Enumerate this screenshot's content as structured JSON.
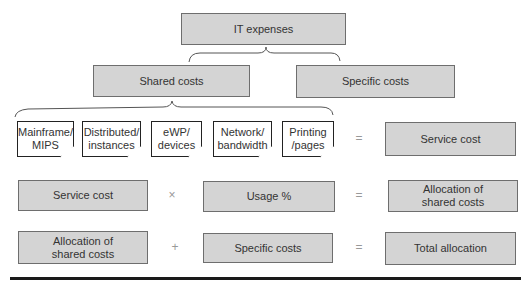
{
  "diagram": {
    "top": {
      "label": "IT expenses"
    },
    "level2": [
      {
        "label": "Shared costs"
      },
      {
        "label": "Specific costs"
      }
    ],
    "shared_components": [
      {
        "label": "Mainframe/\nMIPS"
      },
      {
        "label": "Distributed/\ninstances"
      },
      {
        "label": "eWP/\ndevices"
      },
      {
        "label": "Network/\nbandwidth"
      },
      {
        "label": "Printing\n/pages"
      }
    ],
    "row1": {
      "operator": "=",
      "result": "Service cost"
    },
    "row2": {
      "left": "Service cost",
      "operator": "×",
      "middle": "Usage %",
      "equals": "=",
      "result": "Allocation of\nshared costs"
    },
    "row3": {
      "left": "Allocation of\nshared costs",
      "operator": "+",
      "middle": "Specific costs",
      "equals": "=",
      "result": "Total allocation"
    }
  },
  "colors": {
    "box_fill": "#d4d4d4",
    "box_border": "#6e6e6e",
    "note_fill": "#ffffff",
    "rule": "#1a1a1a"
  }
}
